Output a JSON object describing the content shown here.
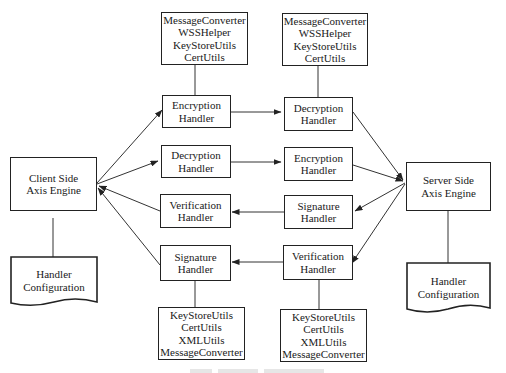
{
  "diagram": {
    "client": {
      "lines": [
        "Client Side",
        "Axis Engine"
      ]
    },
    "server": {
      "lines": [
        "Server Side",
        "Axis Engine"
      ]
    },
    "client_config": {
      "lines": [
        "Handler",
        "Configuration"
      ]
    },
    "server_config": {
      "lines": [
        "Handler",
        "Configuration"
      ]
    },
    "left_handlers": [
      {
        "lines": [
          "Encryption",
          "Handler"
        ]
      },
      {
        "lines": [
          "Decryption",
          "Handler"
        ]
      },
      {
        "lines": [
          "Verification",
          "Handler"
        ]
      },
      {
        "lines": [
          "Signature",
          "Handler"
        ]
      }
    ],
    "right_handlers": [
      {
        "lines": [
          "Decryption",
          "Handler"
        ]
      },
      {
        "lines": [
          "Encryption",
          "Handler"
        ]
      },
      {
        "lines": [
          "Signature",
          "Handler"
        ]
      },
      {
        "lines": [
          "Verification",
          "Handler"
        ]
      }
    ],
    "top_utils_left": {
      "lines": [
        "MessageConverter",
        "WSSHelper",
        "KeyStoreUtils",
        "CertUtils"
      ]
    },
    "top_utils_right": {
      "lines": [
        "MessageConverter",
        "WSSHelper",
        "KeyStoreUtils",
        "CertUtils"
      ]
    },
    "bottom_utils_left": {
      "lines": [
        "KeyStoreUtils",
        "CertUtils",
        "XMLUtils",
        "MessageConverter"
      ]
    },
    "bottom_utils_right": {
      "lines": [
        "KeyStoreUtils",
        "CertUtils",
        "XMLUtils",
        "MessageConverter"
      ]
    },
    "edges": [
      {
        "from": "Client Side Axis Engine",
        "to": "Encryption Handler (left)"
      },
      {
        "from": "Client Side Axis Engine",
        "to": "Decryption Handler (left)"
      },
      {
        "from": "Verification Handler (left)",
        "to": "Client Side Axis Engine"
      },
      {
        "from": "Signature Handler (left)",
        "to": "Client Side Axis Engine"
      },
      {
        "from": "Encryption Handler (left)",
        "to": "Decryption Handler (right)"
      },
      {
        "from": "Decryption Handler (left)",
        "to": "Encryption Handler (right)"
      },
      {
        "from": "Signature Handler (right)",
        "to": "Verification Handler (left)"
      },
      {
        "from": "Verification Handler (right)",
        "to": "Signature Handler (left)"
      },
      {
        "from": "Decryption Handler (right)",
        "to": "Server Side Axis Engine"
      },
      {
        "from": "Encryption Handler (right)",
        "to": "Server Side Axis Engine"
      },
      {
        "from": "Server Side Axis Engine",
        "to": "Signature Handler (right)"
      },
      {
        "from": "Server Side Axis Engine",
        "to": "Verification Handler (right)"
      }
    ]
  }
}
